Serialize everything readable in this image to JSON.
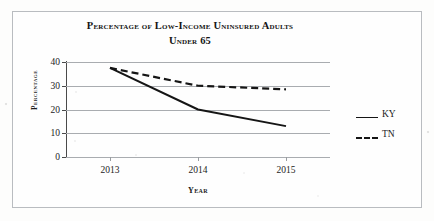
{
  "figure": {
    "title_lines": [
      "Percentage of Low-Income Uninsured Adults",
      "Under 65"
    ],
    "border_color": "#b9bcc0",
    "background_color": "#fefefe"
  },
  "chart_data": {
    "type": "line",
    "title": "Percentage of Low-Income Uninsured Adults Under 65",
    "xlabel": "Year",
    "ylabel": "Percentage",
    "categories": [
      "2013",
      "2014",
      "2015"
    ],
    "x": [
      2013,
      2014,
      2015
    ],
    "series": [
      {
        "name": "KY",
        "values": [
          37.5,
          20.0,
          13.0
        ],
        "style": "solid",
        "color": "#151515"
      },
      {
        "name": "TN",
        "values": [
          37.5,
          30.0,
          28.5
        ],
        "style": "dashed",
        "color": "#151515"
      }
    ],
    "ylim": [
      0,
      40
    ],
    "yticks": [
      0,
      10,
      20,
      30,
      40
    ],
    "ytick_labels": [
      "0",
      "10",
      "20",
      "30",
      "40"
    ],
    "xtick_labels": [
      "2013",
      "2014",
      "2015"
    ],
    "grid": "horizontal",
    "legend_position": "right",
    "legend_entries": [
      "KY",
      "TN"
    ]
  }
}
